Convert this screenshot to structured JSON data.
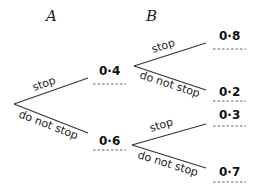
{
  "diagram": {
    "type": "probability-tree",
    "stage_headers": {
      "a": "A",
      "b": "B"
    },
    "first_stage": [
      {
        "label": "stop",
        "probability": "0·4",
        "blank_below": true
      },
      {
        "label": "do not stop",
        "probability": "0·6",
        "blank_below": true
      }
    ],
    "second_stage": {
      "after_stop": [
        {
          "label": "stop",
          "probability": "0·8",
          "blank_below": true
        },
        {
          "label": "do not stop",
          "probability": "0·2",
          "blank_below": true
        }
      ],
      "after_do_not_stop": [
        {
          "label": "stop",
          "probability": "0·3",
          "blank_below": true
        },
        {
          "label": "do not stop",
          "probability": "0·7",
          "blank_below": true
        }
      ]
    }
  }
}
